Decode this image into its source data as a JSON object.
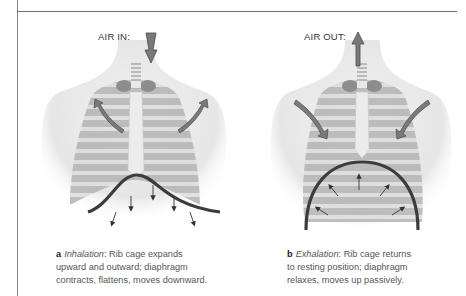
{
  "figure": {
    "panels": [
      {
        "id": "a",
        "airflow_label": "AIR IN:",
        "airflow_direction": "down",
        "caption": {
          "letter": "a",
          "term": "Inhalation",
          "text_line1": ": Rib cage expands",
          "text_line2": "upward and outward; diaphragm",
          "text_line3": "contracts, flattens, moves downward."
        },
        "rib_arrows": "outward",
        "diaphragm_arrows": "downward"
      },
      {
        "id": "b",
        "airflow_label": "AIR OUT:",
        "airflow_direction": "up",
        "caption": {
          "letter": "b",
          "term": "Exhalation",
          "text_line1": ": Rib cage returns",
          "text_line2": "to resting position; diaphragm",
          "text_line3": "relaxes, moves up passively."
        },
        "rib_arrows": "inward",
        "diaphragm_arrows": "upward"
      }
    ],
    "colors": {
      "arrow": "#7a7a7a",
      "arrow_outline": "#4a4a4a",
      "diaphragm": "#3c3c3c",
      "ribs": "#bdbdbd",
      "body": "#eeeeee",
      "lungs": "#a5a5a5"
    }
  }
}
